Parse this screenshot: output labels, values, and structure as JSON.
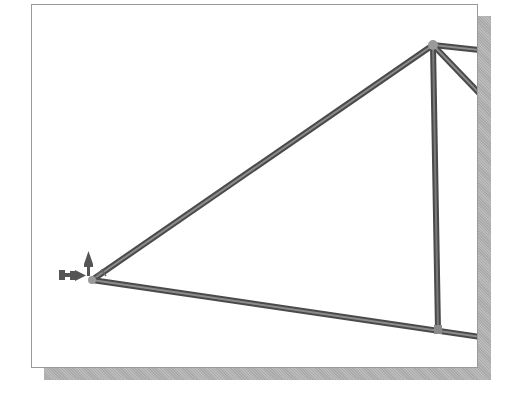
{
  "viewport": {
    "description": "Truss model view with pinned support at left node",
    "panel_color": "#ffffff",
    "border_color": "#9a9a9a",
    "shadow_color": "#b0b0b0"
  },
  "truss": {
    "member_color": "#5a5a5a",
    "member_highlight": "#8c8c8c",
    "joint_color": "#9a9a9a",
    "nodes": [
      {
        "id": "support-node",
        "x": 92,
        "y": 280
      },
      {
        "id": "top-node",
        "x": 433,
        "y": 45
      },
      {
        "id": "bottom-node",
        "x": 438,
        "y": 330
      }
    ],
    "members": [
      {
        "id": "left-diagonal",
        "from": [
          92,
          280
        ],
        "to": [
          433,
          45
        ]
      },
      {
        "id": "bottom-chord",
        "from": [
          92,
          280
        ],
        "to": [
          478,
          337
        ]
      },
      {
        "id": "vertical",
        "from": [
          433,
          45
        ],
        "to": [
          438,
          330
        ]
      },
      {
        "id": "top-chord-right",
        "from": [
          433,
          45
        ],
        "to": [
          478,
          50
        ]
      },
      {
        "id": "right-diagonal",
        "from": [
          433,
          45
        ],
        "to": [
          478,
          92
        ]
      }
    ]
  },
  "support": {
    "type": "pin-support",
    "color": "#555555"
  }
}
